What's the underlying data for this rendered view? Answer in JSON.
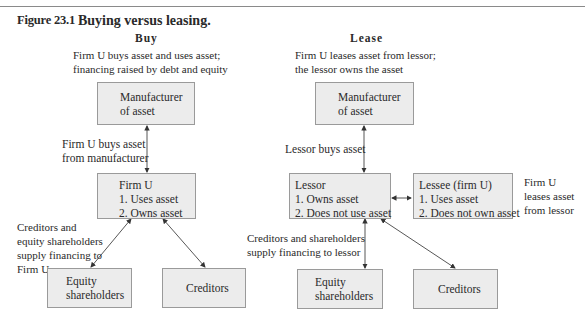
{
  "figure": {
    "number": "Figure 23.1",
    "title": "Buying versus leasing."
  },
  "buy": {
    "heading": "Buy",
    "caption": [
      "Firm U buys asset and uses asset;",
      "financing raised by debt and equity"
    ],
    "manufacturer_box": [
      "Manufacturer",
      "of asset"
    ],
    "purchase_label": [
      "Firm U  buys asset",
      "from manufacturer"
    ],
    "firm_box": {
      "title": "Firm U",
      "items": [
        "1.  Uses asset",
        "2.  Owns asset"
      ]
    },
    "financing_label": [
      "Creditors and",
      "equity shareholders",
      "supply financing to",
      "Firm U"
    ],
    "equity_box": [
      "Equity",
      "shareholders"
    ],
    "creditors_box": "Creditors"
  },
  "lease": {
    "heading": "Lease",
    "caption": [
      "Firm U  leases asset from lessor;",
      "the lessor owns the asset"
    ],
    "manufacturer_box": [
      "Manufacturer",
      "of asset"
    ],
    "purchase_label": "Lessor buys asset",
    "lessor_box": {
      "title": "Lessor",
      "items": [
        "1.  Owns asset",
        "2.  Does not use asset"
      ]
    },
    "lessee_box": {
      "title": "Lessee (firm U)",
      "items": [
        "1.  Uses asset",
        "2.  Does not own asset"
      ]
    },
    "lease_label": [
      "Firm U",
      "leases asset",
      "from lessor"
    ],
    "financing_label": [
      "Creditors and shareholders",
      "supply financing to lessor"
    ],
    "equity_box": [
      "Equity",
      "shareholders"
    ],
    "creditors_box": "Creditors"
  },
  "colors": {
    "box_fill": "#ececec",
    "box_border": "#9a9a9a",
    "text": "#2a2a2a",
    "rule": "#8a8a8a"
  }
}
